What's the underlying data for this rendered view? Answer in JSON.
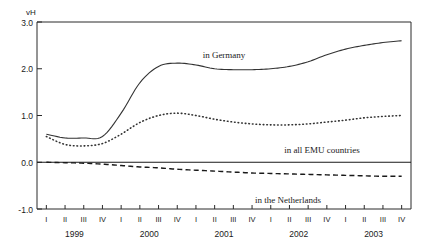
{
  "chart_data": {
    "type": "line",
    "title": "",
    "xlabel": "",
    "ylabel": "vH",
    "ylim": [
      -1.0,
      3.0
    ],
    "yticks": [
      3.0,
      2.0,
      1.0,
      0.0,
      -1.0
    ],
    "ytick_labels": [
      "3.0",
      "2.0",
      "1.0",
      "0.0",
      "-1.0"
    ],
    "grid": false,
    "legend_position": "inline-annotations",
    "zero_reference_line": 0.0,
    "x": [
      "1999 I",
      "1999 II",
      "1999 III",
      "1999 IV",
      "2000 I",
      "2000 II",
      "2000 III",
      "2000 IV",
      "2001 I",
      "2001 II",
      "2001 III",
      "2001 IV",
      "2002 I",
      "2002 II",
      "2002 III",
      "2002 IV",
      "2003 I",
      "2003 II",
      "2003 III",
      "2003 IV"
    ],
    "quarter_labels": [
      "I",
      "II",
      "III",
      "IV",
      "I",
      "II",
      "III",
      "IV",
      "I",
      "II",
      "III",
      "IV",
      "I",
      "II",
      "III",
      "IV",
      "I",
      "II",
      "III",
      "IV"
    ],
    "year_labels": [
      "1999",
      "2000",
      "2001",
      "2002",
      "2003"
    ],
    "series": [
      {
        "name": "in Germany",
        "style": "solid",
        "values": [
          0.6,
          0.52,
          0.52,
          0.55,
          1.05,
          1.7,
          2.05,
          2.12,
          2.08,
          2.0,
          1.98,
          1.98,
          2.0,
          2.05,
          2.15,
          2.3,
          2.42,
          2.5,
          2.56,
          2.6
        ]
      },
      {
        "name": "in all EMU countries",
        "style": "dotted",
        "values": [
          0.55,
          0.38,
          0.35,
          0.4,
          0.6,
          0.85,
          1.0,
          1.05,
          1.0,
          0.92,
          0.86,
          0.82,
          0.8,
          0.8,
          0.82,
          0.86,
          0.9,
          0.95,
          0.98,
          1.0
        ]
      },
      {
        "name": "in the Netherlands",
        "style": "dashed",
        "values": [
          0.0,
          -0.01,
          -0.02,
          -0.04,
          -0.07,
          -0.1,
          -0.12,
          -0.15,
          -0.17,
          -0.19,
          -0.21,
          -0.23,
          -0.24,
          -0.25,
          -0.26,
          -0.27,
          -0.28,
          -0.29,
          -0.3,
          -0.3
        ]
      }
    ],
    "annotations": [
      {
        "text": "in Germany",
        "x_px": 224,
        "y_px": 58
      },
      {
        "text": "in all EMU countries",
        "x_px": 322,
        "y_px": 153
      },
      {
        "text": "in the Netherlands",
        "x_px": 288,
        "y_px": 203
      }
    ]
  },
  "axis": {
    "unit_label": "vH"
  }
}
